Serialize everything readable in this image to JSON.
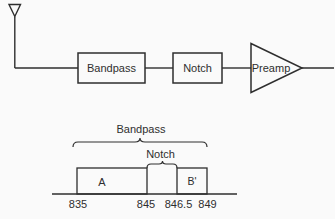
{
  "diagram": {
    "colors": {
      "background": "#fafafa",
      "line": "#2e2e2e"
    },
    "signal_chain": {
      "source_icon": "antenna",
      "blocks": [
        {
          "type": "box",
          "label": "Bandpass"
        },
        {
          "type": "box",
          "label": "Notch"
        },
        {
          "type": "amplifier-triangle",
          "label": "Preamp"
        }
      ]
    },
    "frequency_plot": {
      "braces": [
        {
          "label": "Bandpass",
          "span_mhz": [
            835,
            849
          ]
        },
        {
          "label": "Notch",
          "span_mhz": [
            845,
            846.5
          ]
        }
      ],
      "bands": [
        {
          "label": "A",
          "from_mhz": 835,
          "to_mhz": 845
        },
        {
          "label": "B'",
          "from_mhz": 846.5,
          "to_mhz": 849
        }
      ],
      "axis_ticks": [
        "835",
        "845",
        "846.5",
        "849"
      ]
    }
  }
}
